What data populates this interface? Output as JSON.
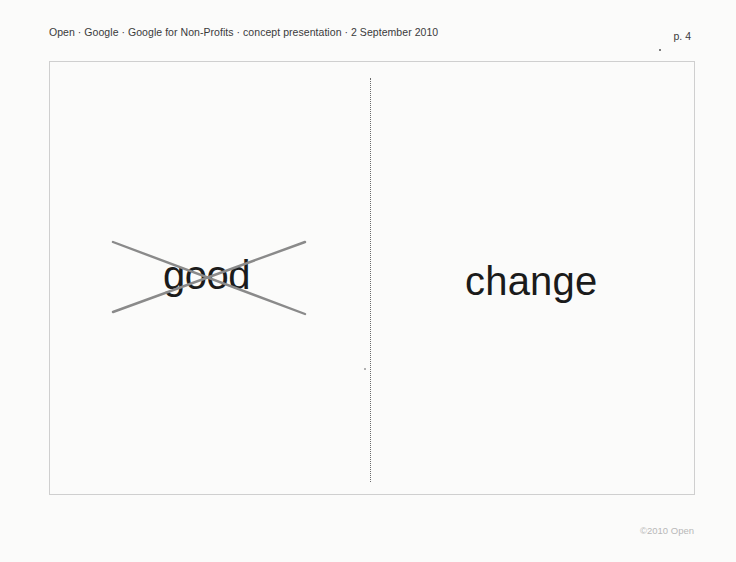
{
  "header": {
    "breadcrumb": "Open · Google · Google for Non-Profits · concept presentation · 2 September 2010",
    "page_number": "p. 4"
  },
  "slide": {
    "left_panel": {
      "word": "good",
      "crossed_out": true,
      "strike_color": "#8a8a8a"
    },
    "right_panel": {
      "word": "change"
    },
    "divider_style": "dotted"
  },
  "footer": {
    "copyright": "©2010 Open"
  },
  "colors": {
    "background": "#fbfbfa",
    "frame_border": "#cfcfcf",
    "text": "#1b1b1b",
    "strike": "#8a8a8a",
    "footer_text": "#b8b8b8"
  }
}
